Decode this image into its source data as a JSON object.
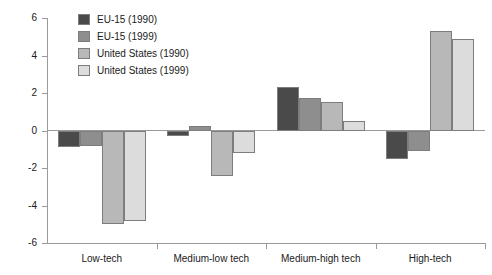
{
  "chart_data": {
    "type": "bar",
    "title": "",
    "xlabel": "",
    "ylabel": "",
    "ylim": [
      -6,
      6
    ],
    "ytick_labels": [
      "6",
      "4",
      "2",
      "0",
      "-2",
      "-4",
      "-6"
    ],
    "ytick_values": [
      6,
      4,
      2,
      0,
      -2,
      -4,
      -6
    ],
    "grid": false,
    "legend_position": "top-left-inside",
    "categories": [
      "Low-tech",
      "Medium-low tech",
      "Medium-high tech",
      "High-tech"
    ],
    "series": [
      {
        "name": "EU-15 (1990)",
        "color": "#4a4a4a",
        "values": [
          -0.9,
          -0.3,
          2.3,
          -1.5
        ]
      },
      {
        "name": "EU-15 (1999)",
        "color": "#8e8e8e",
        "values": [
          -0.85,
          0.25,
          1.75,
          -1.1
        ]
      },
      {
        "name": "United States (1990)",
        "color": "#b8b8b8",
        "values": [
          -5.0,
          -2.4,
          1.5,
          5.3
        ]
      },
      {
        "name": "United States (1999)",
        "color": "#dcdcdc",
        "values": [
          -4.85,
          -1.2,
          0.5,
          4.9
        ]
      }
    ]
  }
}
